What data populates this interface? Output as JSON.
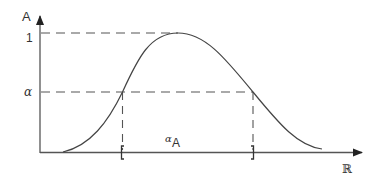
{
  "diagram": {
    "y_axis_label": "A",
    "x_axis_label": "ℝ",
    "y_tick_one": "1",
    "y_tick_alpha": "α",
    "alpha_cut_label_main": "α",
    "alpha_cut_label_sub": "A",
    "left_bracket": "[",
    "right_bracket": "]",
    "colors": {
      "line": "#444444",
      "text": "#333333",
      "background": "#ffffff"
    }
  }
}
